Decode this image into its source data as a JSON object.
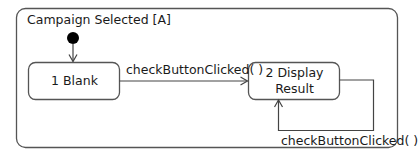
{
  "diagram": {
    "type": "UML state machine",
    "composite_state": {
      "title": "Campaign Selected [A]"
    },
    "initial_pseudostate": "initial-node",
    "states": [
      {
        "id": "s1",
        "line1": "1 Blank",
        "line2": ""
      },
      {
        "id": "s2",
        "line1": "2 Display",
        "line2": "Result"
      }
    ],
    "transitions": [
      {
        "from": "initial",
        "to": "s1",
        "label": ""
      },
      {
        "from": "s1",
        "to": "s2",
        "label": "checkButtonClicked( )"
      },
      {
        "from": "s2",
        "to": "s2",
        "label": "checkButtonClicked( )"
      }
    ],
    "colors": {
      "stroke": "#555555",
      "text": "#1a1a1a",
      "background": "#ffffff"
    }
  }
}
